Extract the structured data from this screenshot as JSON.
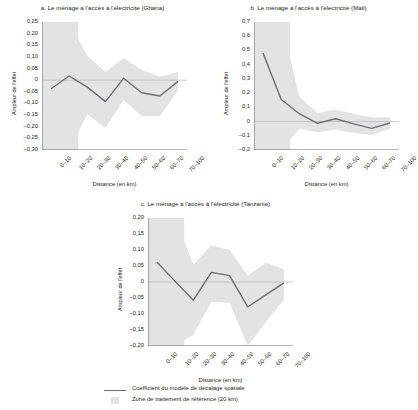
{
  "figure": {
    "xlabel": "Distance (en km)",
    "ylabel": "Ampleur de l'effet",
    "categories": [
      "0–10",
      "10–20",
      "20–30",
      "30–40",
      "40–50",
      "50–60",
      "60–70",
      "70–100"
    ],
    "colors": {
      "line": "#6d6e71",
      "band": "#e3e3e3",
      "zero_line": "#bcbdc0",
      "axis": "#58595b",
      "text": "#231f20",
      "background": "#ffffff"
    }
  },
  "legend": {
    "line_label": "Coefficient du modèle de décalage spatiale",
    "band_label": "Zone de traitement de référence (20 km)"
  },
  "chart_data": [
    {
      "id": "ghana",
      "type": "line",
      "title": "a. Le ménage a l'accès à l'électricité (Ghana)",
      "xlabel": "Distance (en km)",
      "ylabel": "Ampleur de l'effet",
      "categories": [
        "0–10",
        "10–20",
        "20–30",
        "30–40",
        "40–50",
        "50–60",
        "60–70",
        "70–100"
      ],
      "values": [
        -0.037,
        0.018,
        -0.03,
        -0.092,
        0.008,
        -0.054,
        -0.068,
        -0.005
      ],
      "ci_upper": [
        0.25,
        0.25,
        0.105,
        0.035,
        0.095,
        0.045,
        0.015,
        0.035
      ],
      "ci_lower": [
        -0.3,
        -0.3,
        -0.145,
        -0.205,
        -0.085,
        -0.155,
        -0.155,
        -0.045
      ],
      "ylim": [
        -0.3,
        0.25
      ],
      "yticks": [
        "0,25",
        "0,20",
        "0,15",
        "0,10",
        "0,05",
        "0",
        "–0,05",
        "–0,10",
        "–0,15",
        "–0,20",
        "–0,25",
        "–0,30"
      ],
      "ytick_values": [
        0.25,
        0.2,
        0.15,
        0.1,
        0.05,
        0,
        -0.05,
        -0.1,
        -0.15,
        -0.2,
        -0.25,
        -0.3
      ],
      "reference_zone_km": 20,
      "grid": false,
      "legend_position": "below-figure"
    },
    {
      "id": "mali",
      "type": "line",
      "title": "b. Le ménage a l'accès à l'électricité (Mali)",
      "xlabel": "Distance (en km)",
      "ylabel": "Ampleur de l'effet",
      "categories": [
        "0–10",
        "10–20",
        "20–30",
        "30–40",
        "40–50",
        "50–60",
        "60–70",
        "70–100"
      ],
      "values": [
        0.482,
        0.155,
        0.055,
        -0.012,
        0.02,
        -0.016,
        -0.048,
        -0.01
      ],
      "ci_upper": [
        0.7,
        0.7,
        0.175,
        0.06,
        0.085,
        0.055,
        0.03,
        0.03
      ],
      "ci_lower": [
        -0.2,
        -0.2,
        -0.05,
        -0.075,
        -0.055,
        -0.08,
        -0.095,
        -0.05
      ],
      "ylim": [
        -0.2,
        0.7
      ],
      "yticks": [
        "0,7",
        "0,6",
        "0,5",
        "0,4",
        "0,3",
        "0,2",
        "0,1",
        "0",
        "–0,1",
        "–0,2"
      ],
      "ytick_values": [
        0.7,
        0.6,
        0.5,
        0.4,
        0.3,
        0.2,
        0.1,
        0,
        -0.1,
        -0.2
      ],
      "reference_zone_km": 20,
      "grid": false,
      "legend_position": "below-figure"
    },
    {
      "id": "tanzanie",
      "type": "line",
      "title": "c. Le ménage a l'accès à l'électricité (Tanzanie)",
      "xlabel": "Distance (en km)",
      "ylabel": "Ampleur de l'effet",
      "categories": [
        "0–10",
        "10–20",
        "20–30",
        "30–40",
        "40–50",
        "50–60",
        "60–70",
        "70–100"
      ],
      "values": [
        0.062,
        0.002,
        -0.057,
        0.03,
        0.02,
        -0.078,
        -0.04,
        -0.003
      ],
      "ci_upper": [
        0.2,
        0.2,
        0.055,
        0.115,
        0.1,
        0.02,
        0.06,
        0.04
      ],
      "ci_lower": [
        -0.2,
        -0.2,
        -0.165,
        -0.062,
        -0.065,
        -0.2,
        -0.125,
        -0.055
      ],
      "ylim": [
        -0.2,
        0.2
      ],
      "yticks": [
        "0,20",
        "0,15",
        "0,10",
        "0,05",
        "0",
        "–0,05",
        "–0,10",
        "–0,15",
        "–0,20"
      ],
      "ytick_values": [
        0.2,
        0.15,
        0.1,
        0.05,
        0,
        -0.05,
        -0.1,
        -0.15,
        -0.2
      ],
      "reference_zone_km": 20,
      "grid": false,
      "legend_position": "below-figure"
    }
  ]
}
